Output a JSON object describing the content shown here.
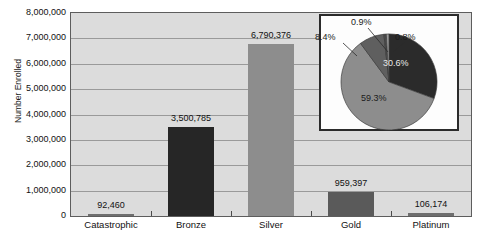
{
  "chart_data": {
    "type": "bar",
    "title": "",
    "xlabel": "",
    "ylabel": "Number Enrolled",
    "categories": [
      "Catastrophic",
      "Bronze",
      "Silver",
      "Gold",
      "Platinum"
    ],
    "values": [
      92460,
      3500785,
      6790376,
      959397,
      106174
    ],
    "value_labels": [
      "92,460",
      "3,500,785",
      "6,790,376",
      "959,397",
      "106,174"
    ],
    "bar_colors": [
      "#6e6e6e",
      "#262626",
      "#8d8d8d",
      "#5a5a5a",
      "#6e6e6e"
    ],
    "ylim": [
      0,
      8000000
    ],
    "ytick_values": [
      0,
      1000000,
      2000000,
      3000000,
      4000000,
      5000000,
      6000000,
      7000000,
      8000000
    ],
    "ytick_labels": [
      "0",
      "1,000,000",
      "2,000,000",
      "3,000,000",
      "4,000,000",
      "5,000,000",
      "6,000,000",
      "7,000,000",
      "8,000,000"
    ],
    "grid": true,
    "legend": "none",
    "plot_background": "#dcdcdc",
    "inset": {
      "type": "pie",
      "labels": [
        "Silver",
        "Bronze",
        "Gold",
        "Catastrophic",
        "Platinum"
      ],
      "values": [
        59.3,
        30.6,
        8.4,
        0.8,
        0.9
      ],
      "value_labels": [
        "59.3%",
        "30.6%",
        "8.4%",
        "0.8%",
        "0.9%"
      ],
      "colors": [
        "#8d8d8d",
        "#2b2b2b",
        "#5f5f5f",
        "#4a4a4a",
        "#9c9c9c"
      ],
      "border_color": "#2b2b2b",
      "background": "#fdfdfd"
    }
  },
  "caption": ""
}
